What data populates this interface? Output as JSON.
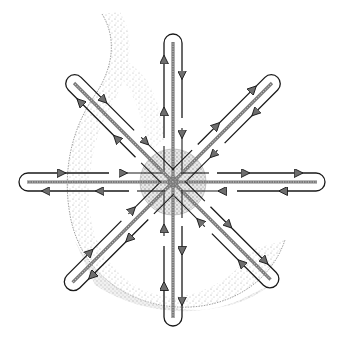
{
  "figure": {
    "center": [
      173,
      182
    ],
    "areola_radius": 33,
    "colors": {
      "ink": "#1a1a1a",
      "stipple": "#9a9a9a",
      "arrow_fill": "#6e6e6e",
      "background": "#ffffff"
    },
    "spokes": [
      {
        "name": "north",
        "angle": -90,
        "length": 148
      },
      {
        "name": "north-east",
        "angle": -45,
        "length": 148
      },
      {
        "name": "east",
        "angle": 0,
        "length": 152
      },
      {
        "name": "south-east",
        "angle": 45,
        "length": 146
      },
      {
        "name": "south",
        "angle": 90,
        "length": 144
      },
      {
        "name": "south-west",
        "angle": 135,
        "length": 150
      },
      {
        "name": "west",
        "angle": 180,
        "length": 154
      },
      {
        "name": "north-west",
        "angle": -135,
        "length": 148
      }
    ]
  }
}
